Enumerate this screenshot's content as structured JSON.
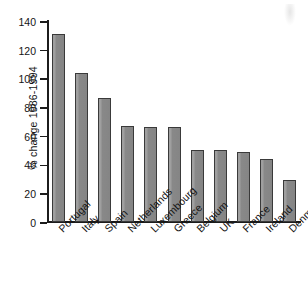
{
  "chart_data": {
    "type": "bar",
    "title": "",
    "subtitle": "",
    "xlabel": "",
    "ylabel": "% change 1986-1994",
    "ylim": [
      0,
      140
    ],
    "ytick_step": 20,
    "yticks": [
      140,
      120,
      100,
      80,
      60,
      40,
      20,
      0
    ],
    "ytick_labels": [
      "140",
      "120",
      "100",
      "80",
      "60",
      "40",
      "20",
      "0"
    ],
    "grid": false,
    "legend": null,
    "orientation": "vertical",
    "bar_color": "#8d8d8d",
    "bar_edge_color": "#3a3a3a",
    "axis_color": "#1c1c1c",
    "background_color": "#ffffff",
    "categories": [
      "Portugal",
      "Italy",
      "Spain",
      "Netherlands",
      "Luxembourg",
      "Greece",
      "Belgium",
      "UK",
      "France",
      "Ireland",
      "Denmark"
    ],
    "values": [
      131,
      104,
      86.5,
      67,
      66.5,
      66,
      50.5,
      50,
      49,
      44,
      29
    ],
    "label_rotation": -45
  }
}
